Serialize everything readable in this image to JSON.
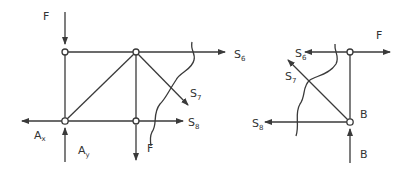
{
  "diagram": {
    "type": "truss free-body diagrams (method of sections)",
    "stroke_color": "#3a3a3a",
    "left_section": {
      "labels": {
        "F_top": "F",
        "S6": {
          "base": "S",
          "sub": "6"
        },
        "S7": {
          "base": "S",
          "sub": "7"
        },
        "S8": {
          "base": "S",
          "sub": "8"
        },
        "Ax": {
          "base": "A",
          "sub": "x"
        },
        "Ay": {
          "base": "A",
          "sub": "y"
        },
        "F_bottom": "F"
      }
    },
    "right_section": {
      "labels": {
        "F": "F",
        "S6": {
          "base": "S",
          "sub": "6"
        },
        "S7": {
          "base": "S",
          "sub": "7"
        },
        "S8": {
          "base": "S",
          "sub": "8"
        },
        "B_node": "B",
        "B_force": "B"
      }
    }
  }
}
